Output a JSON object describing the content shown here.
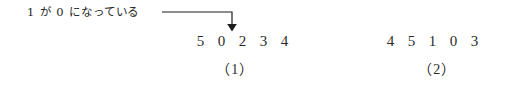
{
  "annotation": {
    "text": "1 が 0 になっている",
    "arrow": {
      "icon": "elbow-down-arrow-icon",
      "color": "#1d1d1d"
    }
  },
  "sequences": [
    {
      "id": "sequence-1",
      "caption": "（1）",
      "digits": [
        "5",
        "0",
        "2",
        "3",
        "4"
      ],
      "highlighted_index": 1
    },
    {
      "id": "sequence-2",
      "caption": "（2）",
      "digits": [
        "4",
        "5",
        "1",
        "0",
        "3"
      ],
      "highlighted_index": null
    }
  ],
  "colors": {
    "background": "#ffffff",
    "text": "#2b2b2b",
    "line": "#1d1d1d"
  }
}
